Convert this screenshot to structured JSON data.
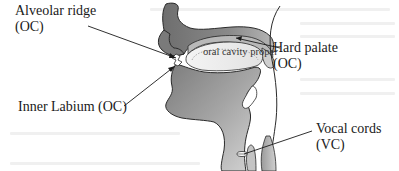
{
  "figure": {
    "type": "mid-sagittal anatomical sketch of the head and neck",
    "colors": {
      "background": "#ffffff",
      "tissue_dark": "#7a7a7a",
      "tissue_mid": "#a8a8a8",
      "tissue_light": "#d9d9d9",
      "cavity_fill": "#ebebeb",
      "outline": "#2a2a2a",
      "text": "#1a1a1a"
    }
  },
  "labels": {
    "alveolar_ridge": {
      "line1": "Alveolar ridge",
      "line2": "(OC)"
    },
    "inner_labium": {
      "line1": "Inner Labium (OC)"
    },
    "hard_palate": {
      "line1": "Hard palate",
      "line2": "(OC)"
    },
    "vocal_cords": {
      "line1": "Vocal cords",
      "line2": "(VC)"
    },
    "oral_cavity": {
      "line1": "oral cavity",
      "line2": "proper"
    }
  }
}
